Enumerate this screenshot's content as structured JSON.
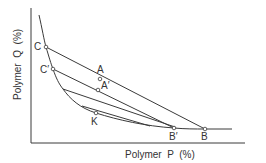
{
  "diagram": {
    "type": "phase-diagram",
    "x_axis_label": "Polymer  P  (%)",
    "y_axis_label": "Polymer  Q  (%)",
    "colors": {
      "line": "#3a3a3a",
      "text": "#333333",
      "background": "#ffffff"
    },
    "points": {
      "C": {
        "label": "C",
        "x": 46,
        "y": 47
      },
      "C2": {
        "label": "C′",
        "x": 53,
        "y": 69
      },
      "A": {
        "label": "A",
        "x": 100,
        "y": 79
      },
      "A2": {
        "label": "A′",
        "x": 98,
        "y": 90
      },
      "K": {
        "label": "K",
        "x": 96,
        "y": 112
      },
      "B2": {
        "label": "B′",
        "x": 174,
        "y": 128
      },
      "B": {
        "label": "B",
        "x": 205,
        "y": 129
      }
    },
    "tie_lines": [
      {
        "from": "C",
        "to": "B",
        "via": "A"
      },
      {
        "from": "C′",
        "to": "B′",
        "via": "A′"
      },
      {
        "from": "curve",
        "to": "curve"
      },
      {
        "from": "curve",
        "to": "curve"
      }
    ],
    "binodal_curve": "descending from top-left through C, C′, K (critical point) to B′, B and flattening to the right"
  }
}
